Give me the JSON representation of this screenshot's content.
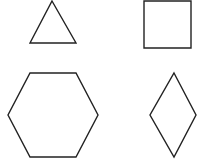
{
  "canvas": {
    "width": 210,
    "height": 165,
    "background": "#ffffff"
  },
  "stroke_color": "#222222",
  "shapes": [
    {
      "name": "triangle",
      "type": "polygon",
      "points": "52,1 76,43 30,43"
    },
    {
      "name": "square",
      "type": "polygon",
      "points": "144,1 191,1 191,48 144,48"
    },
    {
      "name": "hexagon",
      "type": "polygon",
      "points": "30,73 76,73 98,115 76,157 30,157 8,115"
    },
    {
      "name": "diamond",
      "type": "polygon",
      "points": "174,73 196,115 174,157 150,115"
    }
  ]
}
